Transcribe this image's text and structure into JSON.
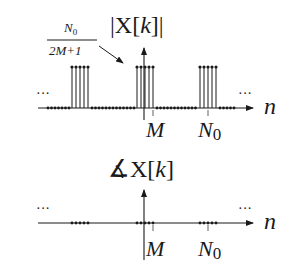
{
  "magnitude_plot": {
    "title_prefix": "|X[",
    "title_var": "k",
    "title_suffix": "]|",
    "height_label": {
      "numerator_main": "N",
      "numerator_sub": "0",
      "denominator": "2M+1"
    },
    "x_axis_label": "n",
    "tick_labels": {
      "m": "M",
      "n0_main": "N",
      "n0_sub": "0"
    },
    "ellipsis_left": "···",
    "ellipsis_right": "···"
  },
  "phase_plot": {
    "title_angle": "∡",
    "title_prefix": "X[",
    "title_var": "k",
    "title_suffix": "]",
    "x_axis_label": "n",
    "tick_labels": {
      "m": "M",
      "n0_main": "N",
      "n0_sub": "0"
    },
    "ellipsis_left": "···",
    "ellipsis_right": "···"
  },
  "colors": {
    "ink": "#1a1a1a",
    "background": "#ffffff"
  }
}
